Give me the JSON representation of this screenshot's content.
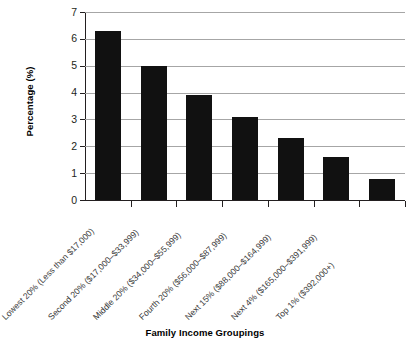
{
  "chart_data": {
    "type": "bar",
    "title": "",
    "subtitle": "",
    "xlabel": "Family Income Groupings",
    "ylabel": "Percentage (%)",
    "ylim": [
      0,
      7
    ],
    "yticks": [
      0,
      1,
      2,
      3,
      4,
      5,
      6,
      7
    ],
    "ytick_labels": [
      "0",
      "1",
      "2",
      "3",
      "4",
      "5",
      "6",
      "7"
    ],
    "grid": "horizontal",
    "legend": "none",
    "bar_color": "#111111",
    "gridline_color": "#a6a6a6",
    "axis_color": "#231f20",
    "categories": [
      "Lowest 20% (Less than $17,000)",
      "Second 20% ($17,000–$33,999)",
      "Middle 20% ($34,000–$55,999)",
      "Fourth 20% ($56,000–$87,999)",
      "Next 15% ($88,000–$164,999)",
      "Next 4% ($165,000–$391,999)",
      "Top 1% ($392,000+)"
    ],
    "values": [
      6.3,
      5.0,
      3.9,
      3.1,
      2.3,
      1.6,
      0.8
    ]
  }
}
